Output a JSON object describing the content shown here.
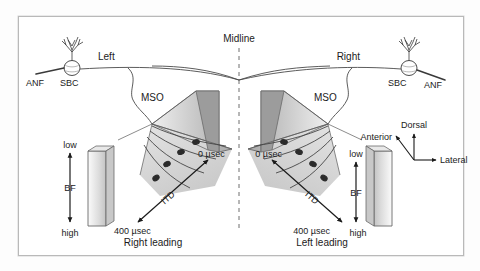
{
  "figure": {
    "title_note": "Schematic of binaural delay lines converging on the medial superior olive (MSO)",
    "background_color": "#ffffff",
    "frame_color": "#b9b9b9",
    "ink_color": "#1b1b1b"
  },
  "midline": {
    "label": "Midline",
    "style": "dashed-vertical"
  },
  "left_side": {
    "anf_label": "ANF",
    "sbc_label": "SBC",
    "pathway_label": "Left",
    "mso_label": "MSO",
    "itd_axis_label": "ITD",
    "itd_min_label": "0 µsec",
    "itd_max_label": "400 µsec",
    "leading_label": "Right leading",
    "bf_axis_label": "BF",
    "bf_low_label": "low",
    "bf_high_label": "high"
  },
  "right_side": {
    "anf_label": "ANF",
    "sbc_label": "SBC",
    "pathway_label": "Right",
    "mso_label": "MSO",
    "itd_axis_label": "ITD",
    "itd_min_label": "0 µsec",
    "itd_max_label": "400 µsec",
    "leading_label": "Left leading",
    "bf_axis_label": "BF",
    "bf_low_label": "low",
    "bf_high_label": "high"
  },
  "orientation_key": {
    "dorsal_label": "Dorsal",
    "anterior_label": "Anterior",
    "lateral_label": "Lateral"
  },
  "icons": {
    "sbc_cell": "neuron-cell-icon",
    "mso_slab": "mso-slab-icon",
    "delay_line": "delay-line-icon",
    "mso_neuron": "mso-neuron-icon",
    "axis_arrow": "double-arrow-icon",
    "midline_dash": "dashed-line-icon"
  }
}
